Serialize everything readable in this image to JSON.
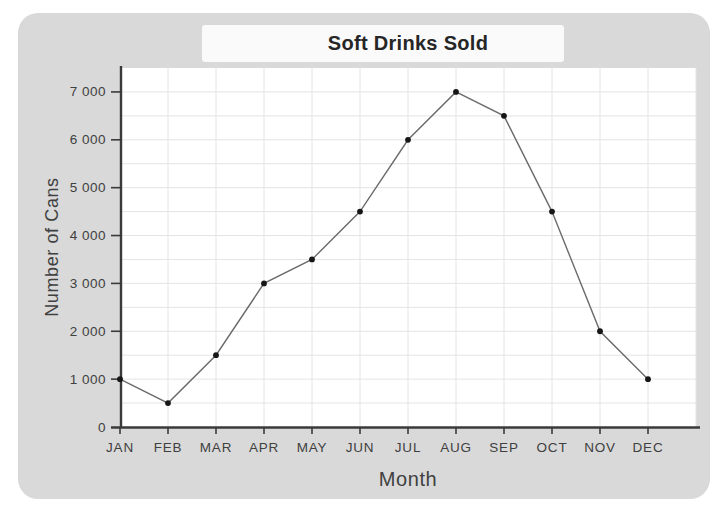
{
  "chart_data": {
    "type": "line",
    "title": "Soft Drinks Sold",
    "xlabel": "Month",
    "ylabel": "Number of Cans",
    "categories": [
      "JAN",
      "FEB",
      "MAR",
      "APR",
      "MAY",
      "JUN",
      "JUL",
      "AUG",
      "SEP",
      "OCT",
      "NOV",
      "DEC"
    ],
    "values": [
      1000,
      500,
      1500,
      3000,
      3500,
      4500,
      6000,
      7000,
      6500,
      4500,
      2000,
      1000
    ],
    "ylim": [
      0,
      7500
    ],
    "ytick_interval": 1000,
    "minor_grid_interval": 500,
    "ytick_labels": [
      "0",
      "1 000",
      "2 000",
      "3 000",
      "4 000",
      "5 000",
      "6 000",
      "7 000"
    ],
    "grid": "on",
    "legend": "none",
    "marker_style": "filled-dot",
    "colors": {
      "panel_background": "#d9d9d9",
      "plot_background": "#ffffff",
      "gridline": "#e4e4e4",
      "axis": "#3a3a3a",
      "line": "#6b6b6b",
      "marker": "#161616",
      "label_text": "#404040",
      "title_text": "#262626"
    }
  }
}
